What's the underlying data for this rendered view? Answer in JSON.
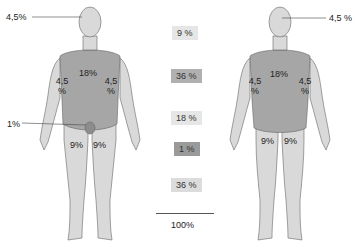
{
  "front_figure": {
    "head_label": "4,5%",
    "trunk_label": "18%",
    "left_arm_label": [
      "4,5",
      "%"
    ],
    "right_arm_label": [
      "4,5",
      "%"
    ],
    "genital_label": "1%",
    "left_leg_label": "9%",
    "right_leg_label": "9%"
  },
  "back_figure": {
    "head_label": "4,5 %",
    "trunk_label": "18%",
    "left_arm_label": [
      "4,5",
      "%"
    ],
    "right_arm_label": [
      "4,5",
      "%"
    ],
    "left_leg_label": "9%",
    "right_leg_label": "9%"
  },
  "summary": {
    "items": [
      {
        "label": "9 %",
        "color": "#e6e6e6"
      },
      {
        "label": "36 %",
        "color": "#b0b0b0"
      },
      {
        "label": "18 %",
        "color": "#e6e6e6"
      },
      {
        "label": "1 %",
        "color": "#9a9a9a"
      },
      {
        "label": "36 %",
        "color": "#dcdcdc"
      }
    ],
    "total": "100%"
  },
  "colors": {
    "skin_light": "#d9d9d9",
    "trunk_dark": "#a6a6a6",
    "outline": "#555555"
  }
}
